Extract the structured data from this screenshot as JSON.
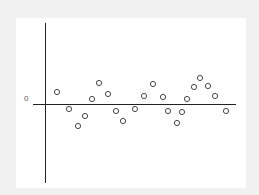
{
  "chart_data": {
    "type": "scatter",
    "title": "",
    "xlabel": "",
    "ylabel": "",
    "y_tick_labels": [
      "0"
    ],
    "grid": false,
    "legend": null,
    "marker": "hollow-circle",
    "axis_origin_px": {
      "x": 45,
      "y": 104
    },
    "x_axis_px_range": [
      33,
      236
    ],
    "y_axis_px_range": [
      23,
      183
    ],
    "points": [
      {
        "x": 1,
        "y": 12
      },
      {
        "x": 2,
        "y": -5
      },
      {
        "x": 3,
        "y": -22
      },
      {
        "x": 4,
        "y": -12
      },
      {
        "x": 5,
        "y": 5
      },
      {
        "x": 6,
        "y": 21
      },
      {
        "x": 7,
        "y": 10
      },
      {
        "x": 8,
        "y": -7
      },
      {
        "x": 9,
        "y": -17
      },
      {
        "x": 10,
        "y": -5
      },
      {
        "x": 11,
        "y": 8
      },
      {
        "x": 12,
        "y": 20
      },
      {
        "x": 13,
        "y": 7
      },
      {
        "x": 14,
        "y": -7
      },
      {
        "x": 15,
        "y": -19
      },
      {
        "x": 16,
        "y": -8
      },
      {
        "x": 17,
        "y": 5
      },
      {
        "x": 18,
        "y": 17
      },
      {
        "x": 19,
        "y": 26
      },
      {
        "x": 20,
        "y": 18
      },
      {
        "x": 21,
        "y": 8
      },
      {
        "x": 22,
        "y": -7
      }
    ],
    "points_px": [
      [
        57,
        92
      ],
      [
        69,
        109
      ],
      [
        78,
        126
      ],
      [
        85,
        116
      ],
      [
        92,
        99
      ],
      [
        99,
        83
      ],
      [
        108,
        94
      ],
      [
        116,
        111
      ],
      [
        123,
        121
      ],
      [
        135,
        109
      ],
      [
        144,
        96
      ],
      [
        153,
        84
      ],
      [
        163,
        97
      ],
      [
        168,
        111
      ],
      [
        177,
        123
      ],
      [
        182,
        112
      ],
      [
        187,
        99
      ],
      [
        194,
        87
      ],
      [
        200,
        78
      ],
      [
        208,
        86
      ],
      [
        215,
        96
      ],
      [
        226,
        111
      ]
    ]
  },
  "labels": {
    "zero": "0"
  }
}
